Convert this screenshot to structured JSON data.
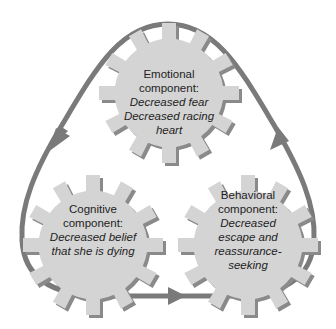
{
  "diagram": {
    "type": "cycle-of-gears",
    "colors": {
      "gear_fill": "#d4d4d4",
      "gear_shadow": "#8a8a8a",
      "loop_stroke": "#7a7a7a",
      "text": "#1e1e1e",
      "background": "#ffffff"
    },
    "loop": {
      "description": "Rounded-triangle loop with arrows indicating a clockwise-like cycle",
      "arrows": [
        {
          "position": "left-side",
          "direction": "down-left"
        },
        {
          "position": "bottom",
          "direction": "right"
        },
        {
          "position": "right-side",
          "direction": "up-left"
        }
      ]
    },
    "gears": [
      {
        "id": "emotional",
        "title_lines": [
          "Emotional",
          "component:"
        ],
        "body_lines": [
          "Decreased fear",
          "Decreased racing",
          "heart"
        ]
      },
      {
        "id": "cognitive",
        "title_lines": [
          "Cognitive",
          "component:"
        ],
        "body_lines": [
          "Decreased belief",
          "that she is dying"
        ]
      },
      {
        "id": "behavioral",
        "title_lines": [
          "Behavioral",
          "component:"
        ],
        "body_lines": [
          "Decreased",
          "escape and",
          "reassurance-",
          "seeking"
        ]
      }
    ]
  }
}
